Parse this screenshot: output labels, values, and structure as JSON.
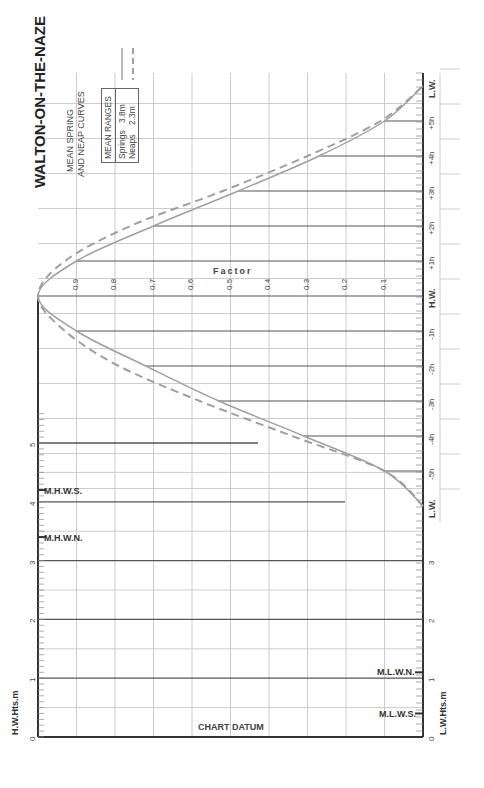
{
  "title": "WALTON-ON-THE-NAZE",
  "subtitle_lines": [
    "MEAN SPRING",
    "AND NEAP CURVES"
  ],
  "legend": {
    "header": "MEAN RANGES",
    "rows": [
      {
        "label": "Springs",
        "value": "3.8m",
        "style": "solid"
      },
      {
        "label": "Neaps",
        "value": "2.3m",
        "style": "dashed"
      }
    ]
  },
  "axes": {
    "factor_label": "Factor",
    "hw_heights_label": "H.W.Hts.m",
    "lw_heights_label": "L.W.Hts.m",
    "chart_datum_label": "CHART DATUM",
    "time_labels": [
      "L.W.",
      "-5h",
      "-4h",
      "-3h",
      "-2h",
      "-1h",
      "H.W.",
      "+1h",
      "+2h",
      "+3h",
      "+4h",
      "+5h",
      "L.W."
    ],
    "factor_ticks": [
      "0.9",
      "0.8",
      "0.7",
      "0.6",
      "0.5",
      "0.4",
      "0.3",
      "0.2",
      "0.1"
    ],
    "height_ticks": [
      "0",
      "1",
      "2",
      "3",
      "4",
      "5"
    ],
    "lw_height_ticks": [
      "0",
      "1",
      "2",
      "3"
    ]
  },
  "levels": [
    {
      "label": "M.H.W.S.",
      "height": 4.2
    },
    {
      "label": "M.H.W.N.",
      "height": 3.4
    },
    {
      "label": "M.L.W.N.",
      "height": 1.1
    },
    {
      "label": "M.L.W.S.",
      "height": 0.4
    }
  ],
  "colors": {
    "curve": "#a0a0a0",
    "axis": "#333333",
    "grid": "#cccccc",
    "hourline": "#555555"
  },
  "chart_data": {
    "type": "line",
    "xlabel": "Time relative to H.W. (hours)",
    "ylabel": "Factor",
    "x": [
      -6,
      -5,
      -4,
      -3,
      -2,
      -1,
      0,
      1,
      2,
      3,
      4,
      5,
      6
    ],
    "series": [
      {
        "name": "Springs (3.8m)",
        "style": "solid",
        "values": [
          0.0,
          0.1,
          0.31,
          0.53,
          0.72,
          0.9,
          1.0,
          0.9,
          0.7,
          0.48,
          0.27,
          0.1,
          0.0
        ]
      },
      {
        "name": "Neaps (2.3m)",
        "style": "dashed",
        "values": [
          0.0,
          0.1,
          0.34,
          0.58,
          0.79,
          0.93,
          1.0,
          0.93,
          0.76,
          0.52,
          0.3,
          0.11,
          0.0
        ]
      }
    ],
    "ylim": [
      0,
      1
    ],
    "height_scale_m": [
      0,
      5
    ],
    "grid": true
  }
}
